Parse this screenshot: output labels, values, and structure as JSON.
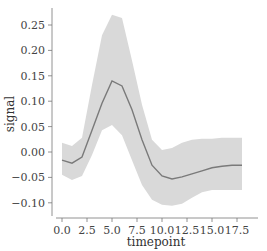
{
  "chart_data": {
    "type": "line",
    "title": "",
    "xlabel": "timepoint",
    "ylabel": "signal",
    "xlim": [
      -0.9,
      18.9
    ],
    "ylim": [
      -0.125,
      0.28
    ],
    "grid": false,
    "xticks": [
      "0.0",
      "2.5",
      "5.0",
      "7.5",
      "10.0",
      "12.5",
      "15.0",
      "17.5"
    ],
    "yticks": [
      "-0.10",
      "-0.05",
      "0.00",
      "0.05",
      "0.10",
      "0.15",
      "0.20",
      "0.25"
    ],
    "x": [
      0,
      1,
      2,
      3,
      4,
      5,
      6,
      7,
      8,
      9,
      10,
      11,
      12,
      13,
      14,
      15,
      16,
      17,
      18
    ],
    "series": [
      {
        "name": "signal mean",
        "color": "#7a7a7a",
        "values": [
          -0.016,
          -0.022,
          -0.01,
          0.043,
          0.096,
          0.14,
          0.13,
          0.083,
          0.024,
          -0.026,
          -0.047,
          -0.053,
          -0.049,
          -0.043,
          -0.037,
          -0.031,
          -0.028,
          -0.026,
          -0.026
        ]
      },
      {
        "name": "ci upper",
        "values": [
          0.018,
          0.012,
          0.028,
          0.132,
          0.23,
          0.27,
          0.264,
          0.18,
          0.093,
          0.024,
          0.004,
          0.008,
          0.018,
          0.024,
          0.026,
          0.026,
          0.028,
          0.028,
          0.028
        ]
      },
      {
        "name": "ci lower",
        "values": [
          -0.045,
          -0.055,
          -0.047,
          -0.006,
          0.043,
          0.053,
          0.033,
          -0.016,
          -0.065,
          -0.094,
          -0.104,
          -0.106,
          -0.102,
          -0.09,
          -0.079,
          -0.075,
          -0.075,
          -0.075,
          -0.075
        ]
      }
    ],
    "band_color": "#d9d9d9",
    "legend": null
  }
}
